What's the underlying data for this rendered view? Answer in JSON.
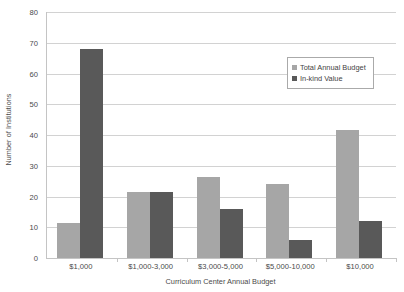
{
  "chart_data": {
    "type": "bar",
    "title": "",
    "xlabel": "Curriculum Center Annual Budget",
    "ylabel": "Number of Institutions",
    "categories": [
      "$1,000",
      "$1,000-3,000",
      "$3,000-5,000",
      "$5,000-10,000",
      "$10,000"
    ],
    "series": [
      {
        "name": "Total Annual Budget",
        "color": "#a6a6a6",
        "values": [
          11.5,
          21.5,
          26.5,
          24,
          41.5
        ]
      },
      {
        "name": "In-kind Value",
        "color": "#595959",
        "values": [
          68,
          21.5,
          16,
          6,
          12
        ]
      }
    ],
    "ylim": [
      0,
      80
    ],
    "yticks": [
      0,
      10,
      20,
      30,
      40,
      50,
      60,
      70,
      80
    ],
    "ytick_labels": [
      "0",
      "10",
      "20",
      "30",
      "40",
      "50",
      "60",
      "70",
      "80"
    ],
    "grid": true,
    "legend_position": "upper-right",
    "axis_color": "#c4c4c4",
    "gridline_color": "#d2d2d2",
    "background": "#ffffff"
  }
}
